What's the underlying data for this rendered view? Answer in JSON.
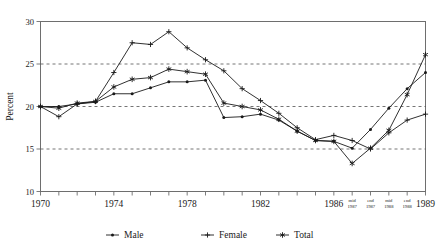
{
  "chart_data": {
    "type": "line",
    "title": "",
    "xlabel": "",
    "ylabel": "Percent",
    "ylim": [
      10,
      30
    ],
    "yticks": [
      10,
      15,
      20,
      25,
      30
    ],
    "grid": "horizontal dashed at 15, 20, 25",
    "legend_position": "bottom-center",
    "categories": [
      "1970",
      "1971",
      "1972",
      "1973",
      "1974",
      "1975",
      "1976",
      "1977",
      "1978",
      "1979",
      "1980",
      "1981",
      "1982",
      "1983",
      "1984",
      "1985",
      "1986",
      "mid 1987",
      "end 1987",
      "mid 1988",
      "end 1988",
      "1989"
    ],
    "xtick_labels_shown": [
      "1970",
      "1974",
      "1978",
      "1982",
      "1986",
      "mid 1987",
      "end 1987",
      "mid 1988",
      "end 1988",
      "1989"
    ],
    "series": [
      {
        "name": "Male",
        "marker": "dot",
        "color": "#1a1a1a",
        "values": [
          20.0,
          20.0,
          20.3,
          20.5,
          21.5,
          21.5,
          22.2,
          22.9,
          22.9,
          23.1,
          18.7,
          18.8,
          19.1,
          18.4,
          17.1,
          16.0,
          15.9,
          15.1,
          17.3,
          19.8,
          22.1,
          24.0
        ]
      },
      {
        "name": "Female",
        "marker": "plus",
        "color": "#1a1a1a",
        "values": [
          20.0,
          18.8,
          20.3,
          20.6,
          24.0,
          27.5,
          27.3,
          28.8,
          26.9,
          25.5,
          24.2,
          22.1,
          20.7,
          19.2,
          17.5,
          16.1,
          16.6,
          16.0,
          15.0,
          16.9,
          18.4,
          19.1
        ]
      },
      {
        "name": "Total",
        "marker": "star",
        "color": "#1a1a1a",
        "values": [
          20.0,
          19.8,
          20.4,
          20.6,
          22.3,
          23.2,
          23.4,
          24.4,
          24.1,
          23.8,
          20.4,
          20.0,
          19.6,
          18.5,
          17.1,
          16.0,
          15.9,
          13.3,
          15.1,
          17.2,
          21.4,
          26.1
        ]
      }
    ]
  },
  "legend": {
    "items": [
      {
        "label": "Male",
        "marker": "dot"
      },
      {
        "label": "Female",
        "marker": "plus"
      },
      {
        "label": "Total",
        "marker": "star"
      }
    ]
  },
  "axis": {
    "y_title": "Percent"
  }
}
